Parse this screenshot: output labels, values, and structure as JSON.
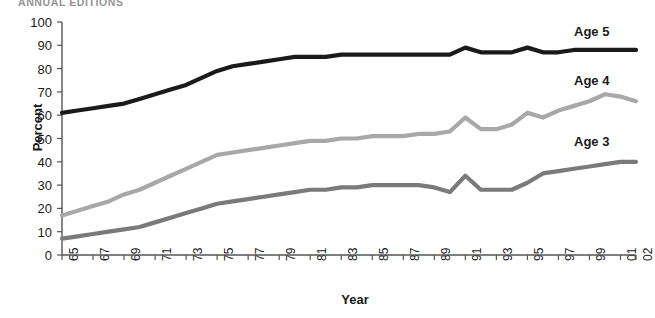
{
  "header": {
    "publication": "ANNUAL EDITIONS"
  },
  "chart_data": {
    "type": "line",
    "title": "",
    "xlabel": "Year",
    "ylabel": "Percent",
    "ylim": [
      0,
      100
    ],
    "ytick_labels": [
      "100",
      "90",
      "80",
      "70",
      "60",
      "50",
      "40",
      "30",
      "20",
      "10",
      "0"
    ],
    "ytick_values": [
      100,
      90,
      80,
      70,
      60,
      50,
      40,
      30,
      20,
      10,
      0
    ],
    "grid": false,
    "legend_position": "inline-right",
    "xtick_labels": [
      "65",
      "67",
      "69",
      "71",
      "73",
      "75",
      "77",
      "79",
      "81",
      "83",
      "85",
      "87",
      "89",
      "91",
      "93",
      "95",
      "97",
      "99",
      "01",
      "02"
    ],
    "x": [
      1965,
      1966,
      1967,
      1968,
      1969,
      1970,
      1971,
      1972,
      1973,
      1974,
      1975,
      1976,
      1977,
      1978,
      1979,
      1980,
      1981,
      1982,
      1983,
      1984,
      1985,
      1986,
      1987,
      1988,
      1989,
      1990,
      1991,
      1992,
      1993,
      1994,
      1995,
      1996,
      1997,
      1998,
      1999,
      2000,
      2001,
      2002
    ],
    "series": [
      {
        "name": "Age 5",
        "color": "#1a1a1a",
        "values": [
          61,
          62,
          63,
          64,
          65,
          67,
          69,
          71,
          73,
          76,
          79,
          81,
          82,
          83,
          84,
          85,
          85,
          85,
          86,
          86,
          86,
          86,
          86,
          86,
          86,
          86,
          89,
          87,
          87,
          87,
          89,
          87,
          87,
          88,
          88,
          88,
          88,
          88
        ]
      },
      {
        "name": "Age 4",
        "color": "#a8a8a8",
        "values": [
          17,
          19,
          21,
          23,
          26,
          28,
          31,
          34,
          37,
          40,
          43,
          44,
          45,
          46,
          47,
          48,
          49,
          49,
          50,
          50,
          51,
          51,
          51,
          52,
          52,
          53,
          59,
          54,
          54,
          56,
          61,
          59,
          62,
          64,
          66,
          69,
          68,
          66
        ]
      },
      {
        "name": "Age 3",
        "color": "#7a7a7a",
        "values": [
          7,
          8,
          9,
          10,
          11,
          12,
          14,
          16,
          18,
          20,
          22,
          23,
          24,
          25,
          26,
          27,
          28,
          28,
          29,
          29,
          30,
          30,
          30,
          30,
          29,
          27,
          34,
          28,
          28,
          28,
          31,
          35,
          36,
          37,
          38,
          39,
          40,
          40
        ]
      }
    ]
  }
}
